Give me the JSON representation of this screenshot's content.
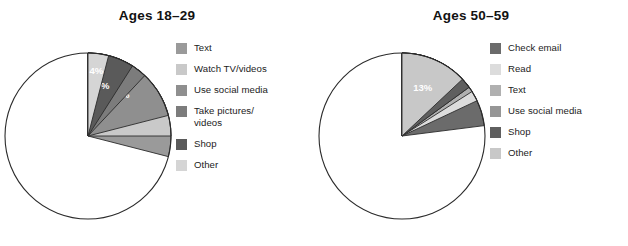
{
  "figure": {
    "background": "#ffffff",
    "panels": [
      {
        "key": "ages_18_29",
        "title": "Ages 18–29",
        "legend": [
          {
            "label": "Text",
            "color": "#9a9a9a"
          },
          {
            "label": "Watch TV/videos",
            "color": "#c9c9c9"
          },
          {
            "label": "Use social media",
            "color": "#8f8f8f"
          },
          {
            "label": "Take pictures/\nvideos",
            "color": "#7c7c7c"
          },
          {
            "label": "Shop",
            "color": "#5a5a5a"
          },
          {
            "label": "Other",
            "color": "#d5d5d5"
          }
        ]
      },
      {
        "key": "ages_50_59",
        "title": "Ages 50–59",
        "legend": [
          {
            "label": "Check email",
            "color": "#6b6b6b"
          },
          {
            "label": "Read",
            "color": "#dcdcdc"
          },
          {
            "label": "Text",
            "color": "#b0b0b0"
          },
          {
            "label": "Use social media",
            "color": "#969696"
          },
          {
            "label": "Shop",
            "color": "#5f5f5f"
          },
          {
            "label": "Other",
            "color": "#c8c8c8"
          }
        ]
      }
    ]
  },
  "chart_data": [
    {
      "type": "pie",
      "title": "Ages 18–29",
      "xlabel": "",
      "ylabel": "",
      "legend_position": "right",
      "grid": false,
      "units": "percent",
      "start_angle_deg": 0,
      "direction": "clockwise",
      "categories": [
        "Text",
        "Watch TV/videos",
        "Use social media",
        "Take pictures/videos",
        "Shop",
        "Other"
      ],
      "values": [
        29,
        25,
        21,
        12,
        9,
        4
      ],
      "labels": [
        "29%",
        "25%",
        "21%",
        "12%",
        "9%",
        "4%"
      ],
      "colors": [
        "#9a9a9a",
        "#c9c9c9",
        "#8f8f8f",
        "#7c7c7c",
        "#5a5a5a",
        "#d5d5d5"
      ],
      "slices": [
        {
          "name": "Text",
          "value": 29,
          "label": "29%",
          "color": "#9a9a9a"
        },
        {
          "name": "Watch TV/videos",
          "value": 25,
          "label": "25%",
          "color": "#c9c9c9"
        },
        {
          "name": "Use social media",
          "value": 21,
          "label": "21%",
          "color": "#8f8f8f"
        },
        {
          "name": "Take pictures/videos",
          "value": 12,
          "label": "12%",
          "color": "#7c7c7c"
        },
        {
          "name": "Shop",
          "value": 9,
          "label": "9%",
          "color": "#5a5a5a"
        },
        {
          "name": "Other",
          "value": 4,
          "label": "4%",
          "color": "#d5d5d5"
        }
      ]
    },
    {
      "type": "pie",
      "title": "Ages 50–59",
      "xlabel": "",
      "ylabel": "",
      "legend_position": "right",
      "grid": false,
      "units": "percent",
      "start_angle_deg": 0,
      "direction": "clockwise",
      "categories": [
        "Check email",
        "Read",
        "Text",
        "Use social media",
        "Shop",
        "Other"
      ],
      "values": [
        23,
        18,
        16,
        15,
        15,
        13
      ],
      "labels": [
        "23%",
        "18%",
        "16%",
        "15%",
        "15%",
        "13%"
      ],
      "colors": [
        "#6b6b6b",
        "#dcdcdc",
        "#b0b0b0",
        "#969696",
        "#5f5f5f",
        "#c8c8c8"
      ],
      "slices": [
        {
          "name": "Check email",
          "value": 23,
          "label": "23%",
          "color": "#6b6b6b"
        },
        {
          "name": "Read",
          "value": 18,
          "label": "18%",
          "color": "#dcdcdc"
        },
        {
          "name": "Text",
          "value": 16,
          "label": "16%",
          "color": "#b0b0b0"
        },
        {
          "name": "Use social media",
          "value": 15,
          "label": "15%",
          "color": "#969696"
        },
        {
          "name": "Shop",
          "value": 15,
          "label": "15%",
          "color": "#5f5f5f"
        },
        {
          "name": "Other",
          "value": 13,
          "label": "13%",
          "color": "#c8c8c8"
        }
      ]
    }
  ]
}
